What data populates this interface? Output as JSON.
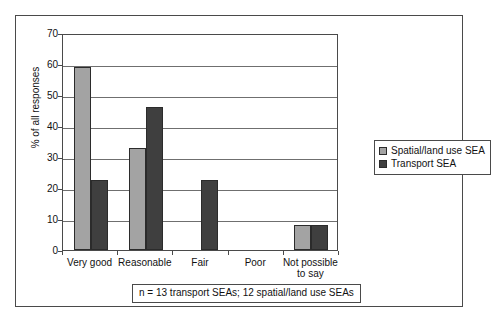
{
  "chart_data": {
    "type": "bar",
    "title": "",
    "subtitle": "",
    "xlabel": "",
    "ylabel": "% of all responses",
    "ylim": [
      0,
      70
    ],
    "ytick_step": 10,
    "yticks": [
      0,
      10,
      20,
      30,
      40,
      50,
      60,
      70
    ],
    "ytick_labels": [
      "0",
      "10",
      "20",
      "30",
      "40",
      "50",
      "60",
      "70"
    ],
    "categories": [
      "Very good",
      "Reasonable",
      "Fair",
      "Poor",
      "Not possible to say"
    ],
    "category_lines": [
      [
        "Very good"
      ],
      [
        "Reasonable"
      ],
      [
        "Fair"
      ],
      [
        "Poor"
      ],
      [
        "Not possible",
        "to say"
      ]
    ],
    "series": [
      {
        "name": "Spatial/land use SEA",
        "color": "#a3a3a3",
        "values": [
          59,
          33,
          0,
          0,
          8
        ]
      },
      {
        "name": "Transport SEA",
        "color": "#3f3f3f",
        "values": [
          22.5,
          46,
          22.5,
          0,
          8
        ]
      }
    ],
    "grid": true,
    "grid_axis": "y",
    "legend_position": "right",
    "annotation": "n = 13 transport SEAs; 12 spatial/land use SEAs"
  },
  "legend": {
    "entries": [
      {
        "label": "Spatial/land use SEA",
        "color": "#a3a3a3"
      },
      {
        "label": "Transport SEA",
        "color": "#3f3f3f"
      }
    ]
  },
  "footnote": {
    "text": "n = 13 transport SEAs; 12 spatial/land use SEAs"
  },
  "colors": {
    "spatial_land_use": "#a3a3a3",
    "transport": "#3f3f3f",
    "axis": "#4a4a4a",
    "grid": "#6f6f6f",
    "text": "#111111",
    "background": "#ffffff"
  }
}
